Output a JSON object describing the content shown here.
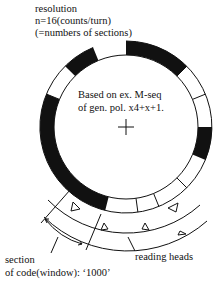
{
  "labels": {
    "resolution_line1": "resolution",
    "resolution_line2": "n=16(counts/turn)",
    "resolution_line3": "(=numbers of sections)",
    "note_line1": "Based on ex. M-seq",
    "note_line2": "of gen. pol. x4+x+1.",
    "section_line1": "section",
    "section_line2": "of code(window): ‘1000’",
    "reading_heads": "reading heads"
  },
  "disk": {
    "sections": 16,
    "center_mark": "crosshair",
    "black_arcs_deg": [
      [
        0,
        45
      ],
      [
        90,
        112.5
      ],
      [
        194,
        292.5
      ],
      [
        315,
        337.5
      ]
    ],
    "dividers_deg": [
      45,
      67.5,
      90,
      112.5,
      135,
      157.5,
      172,
      194,
      292.5,
      315,
      337.5
    ]
  },
  "heads": {
    "count": 6,
    "symbol": "triangle"
  }
}
